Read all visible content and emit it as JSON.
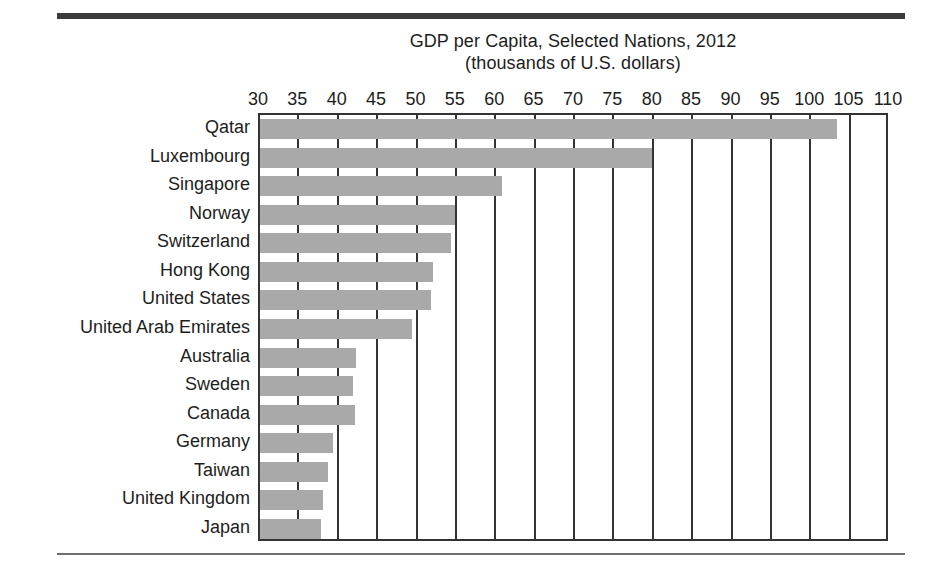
{
  "figure": {
    "title_line1": "GDP per Capita, Selected Nations, 2012",
    "title_line2": "(thousands of U.S. dollars)"
  },
  "chart_data": {
    "type": "bar",
    "orientation": "horizontal",
    "title": "GDP per Capita, Selected Nations, 2012",
    "subtitle": "(thousands of U.S. dollars)",
    "xlabel": "",
    "ylabel": "",
    "xlim": [
      30,
      110
    ],
    "xticks": [
      30,
      35,
      40,
      45,
      50,
      55,
      60,
      65,
      70,
      75,
      80,
      85,
      90,
      95,
      100,
      105,
      110
    ],
    "xtick_labels": [
      "30",
      "35",
      "40",
      "45",
      "50",
      "55",
      "60",
      "65",
      "70",
      "75",
      "80",
      "85",
      "90",
      "95",
      "100",
      "105",
      "110"
    ],
    "grid": true,
    "legend": "none",
    "bar_color": "#a9a9a9",
    "axis_color": "#333333",
    "categories": [
      "Qatar",
      "Luxembourg",
      "Singapore",
      "Norway",
      "Switzerland",
      "Hong Kong",
      "United States",
      "United Arab Emirates",
      "Australia",
      "Sweden",
      "Canada",
      "Germany",
      "Taiwan",
      "United Kingdom",
      "Japan"
    ],
    "values": [
      103.5,
      80.0,
      61.0,
      55.0,
      54.5,
      52.2,
      52.0,
      49.5,
      42.5,
      42.0,
      42.3,
      39.5,
      38.9,
      38.2,
      38.0
    ]
  }
}
